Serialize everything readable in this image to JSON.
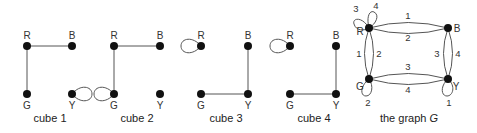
{
  "figure": {
    "cubes": [
      {
        "caption": "cube 1",
        "vertices": {
          "R": "R",
          "B": "B",
          "G": "G",
          "Y": "Y"
        },
        "edges": [
          [
            "R",
            "B"
          ],
          [
            "R",
            "G"
          ]
        ],
        "loops": [
          "Y"
        ]
      },
      {
        "caption": "cube 2",
        "vertices": {
          "R": "R",
          "B": "B",
          "G": "G",
          "Y": "Y"
        },
        "edges": [
          [
            "R",
            "B"
          ],
          [
            "R",
            "G"
          ]
        ],
        "loops": [
          "G"
        ]
      },
      {
        "caption": "cube 3",
        "vertices": {
          "R": "R",
          "B": "B",
          "G": "G",
          "Y": "Y"
        },
        "edges": [
          [
            "B",
            "Y"
          ],
          [
            "G",
            "Y"
          ]
        ],
        "loops": [
          "R"
        ]
      },
      {
        "caption": "cube 4",
        "vertices": {
          "R": "R",
          "B": "B",
          "G": "G",
          "Y": "Y"
        },
        "edges": [
          [
            "B",
            "Y"
          ],
          [
            "G",
            "Y"
          ]
        ],
        "loops": [
          "R"
        ]
      }
    ],
    "graph": {
      "caption_prefix": "the graph ",
      "caption_symbol": "G",
      "vertices": {
        "R": "R",
        "B": "B",
        "G": "G",
        "Y": "Y"
      },
      "edge_labels": {
        "RB_top": "1",
        "RB_bottom": "2",
        "RG_left": "1",
        "RG_right": "2",
        "GY_top": "3",
        "GY_bottom": "4",
        "BY_left": "3",
        "BY_right": "4",
        "R_loop_left": "3",
        "R_loop_top": "4",
        "G_loop": "2",
        "Y_loop": "1"
      }
    }
  }
}
